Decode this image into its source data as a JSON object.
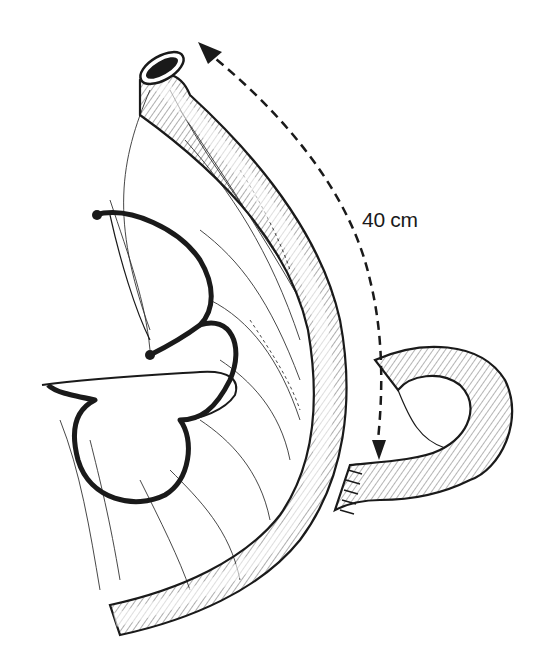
{
  "figure": {
    "measurement_label": "40 cm",
    "colors": {
      "ink": "#1a1a1a",
      "background": "#ffffff"
    }
  }
}
